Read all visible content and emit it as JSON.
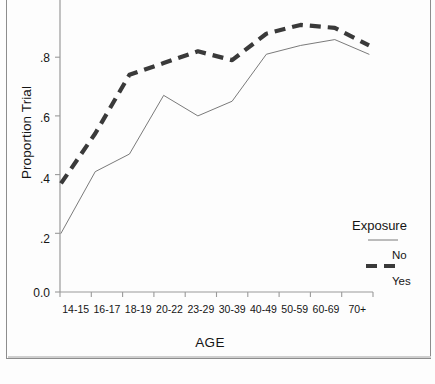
{
  "chart_data": {
    "type": "line",
    "title": "",
    "xlabel": "AGE",
    "ylabel": "Proportion Trial",
    "categories": [
      "14-15",
      "16-17",
      "18-19",
      "20-22",
      "23-29",
      "30-39",
      "40-49",
      "50-59",
      "60-69",
      "70+"
    ],
    "ylim": [
      0.0,
      1.0
    ],
    "yticks": [
      "0.0",
      ".2",
      ".4",
      ".6",
      ".8"
    ],
    "ytick_values": [
      0.0,
      0.2,
      0.4,
      0.6,
      0.8
    ],
    "grid": false,
    "legend_position": "right",
    "legend_title": "Exposure",
    "series": [
      {
        "name": "No",
        "style": "solid-thin",
        "color": "#6b6b6b",
        "values": [
          0.2,
          0.41,
          0.47,
          0.67,
          0.6,
          0.65,
          0.81,
          0.84,
          0.86,
          0.81
        ]
      },
      {
        "name": "Yes",
        "style": "dashed-thick",
        "color": "#3a3a3a",
        "values": [
          0.37,
          0.54,
          0.74,
          0.78,
          0.82,
          0.79,
          0.88,
          0.91,
          0.9,
          0.84
        ]
      }
    ]
  },
  "axes": {
    "y_label": "Proportion Trial",
    "x_label": "AGE"
  },
  "legend": {
    "title": "Exposure",
    "entries": [
      {
        "label": "No"
      },
      {
        "label": "Yes"
      }
    ]
  },
  "ticks": {
    "y": [
      "0.0",
      ".2",
      ".4",
      ".6",
      ".8"
    ],
    "x": [
      "14-15",
      "16-17",
      "18-19",
      "20-22",
      "23-29",
      "30-39",
      "40-49",
      "50-59",
      "60-69",
      "70+"
    ]
  }
}
